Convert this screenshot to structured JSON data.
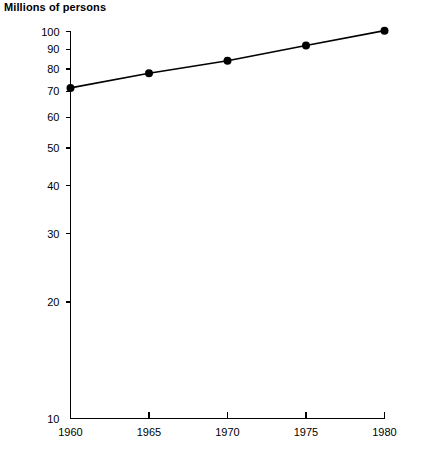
{
  "chart_data": {
    "type": "line",
    "title": "Millions of persons",
    "subtitle": "",
    "xlabel": "",
    "ylabel": "Millions of persons",
    "x": [
      1960,
      1965,
      1970,
      1975,
      1980
    ],
    "xticklabels": [
      "1960",
      "1965",
      "1970",
      "1975",
      "1980"
    ],
    "yticks": [
      10,
      20,
      30,
      40,
      50,
      60,
      70,
      80,
      90,
      100
    ],
    "yticklabels": [
      "10",
      "20",
      "30",
      "40",
      "50",
      "60",
      "70",
      "80",
      "90",
      "100"
    ],
    "yscale": "log",
    "ylim": [
      10,
      101
    ],
    "xlim": [
      1960,
      1980
    ],
    "grid": false,
    "legend": false,
    "series": [
      {
        "name": "Millions of persons",
        "color": "#000000",
        "marker": "filled-circle",
        "values": [
          71.5,
          78.0,
          84.0,
          92.0,
          100.5
        ]
      }
    ]
  },
  "colors": {
    "background": "#ffffff",
    "axis": "#000000",
    "series": "#000000",
    "text": "#000000"
  }
}
